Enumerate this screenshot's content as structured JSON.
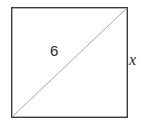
{
  "figure": {
    "type": "geometry-diagram",
    "shape": "square",
    "background_color": "#ffffff",
    "square": {
      "name": "square-outline",
      "stroke_color": "#3a3a3a",
      "stroke_width": 1.4,
      "fill": "none",
      "left": 11,
      "top": 7,
      "right": 127,
      "bottom": 117
    },
    "diagonal": {
      "name": "diagonal-line",
      "stroke_color": "#a6a6a6",
      "stroke_width": 1,
      "from_x": 11,
      "from_y": 117,
      "to_x": 127,
      "to_y": 7
    },
    "labels": {
      "diagonal": "6",
      "side": "x"
    }
  }
}
